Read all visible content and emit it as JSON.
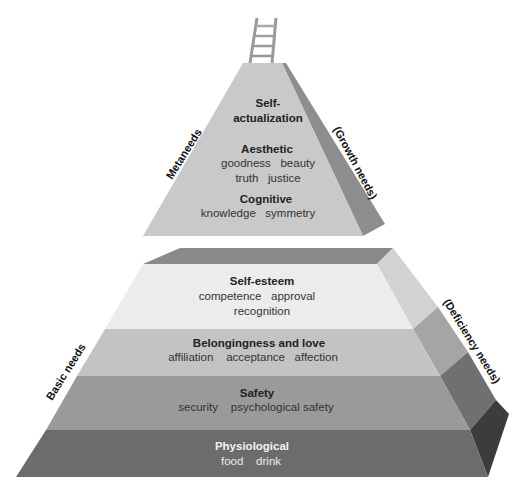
{
  "diagram": {
    "top_pyramid": {
      "side_label_left": "Metaneeds",
      "side_label_right": "(Growth needs)",
      "levels": [
        {
          "title_line1": "Self-",
          "title_line2": "actualization"
        },
        {
          "title": "Aesthetic",
          "items_line1": "goodness   beauty",
          "items_line2": "truth   justice"
        },
        {
          "title": "Cognitive",
          "items_line1": "knowledge   symmetry"
        }
      ]
    },
    "bottom_pyramid": {
      "side_label_left": "Basic needs",
      "side_label_right": "(Deficiency needs)",
      "levels": [
        {
          "title": "Self-esteem",
          "items_line1": "competence   approval",
          "items_line2": "recognition"
        },
        {
          "title": "Belongingness and love",
          "items_line1": "affiliation    acceptance   affection"
        },
        {
          "title": "Safety",
          "items_line1": "security    psychological safety"
        },
        {
          "title": "Physiological",
          "items_line1": "food    drink"
        }
      ]
    },
    "ladder_icon": "ladder-icon",
    "colors": {
      "top_front": "#c9c9c9",
      "top_side": "#8e8e8e",
      "bottom_top_face": "#8a8a8a",
      "self_esteem": "#ececec",
      "self_esteem_side": "#d2d2d2",
      "belonging": "#c3c3c3",
      "belonging_side": "#a5a5a5",
      "safety": "#9a9a9a",
      "safety_side": "#707070",
      "physiological": "#6c6c6c",
      "physiological_side": "#3c3c3c"
    }
  }
}
